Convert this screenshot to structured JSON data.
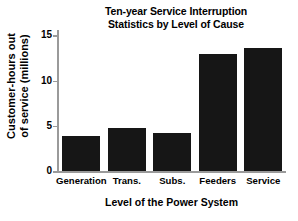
{
  "chart_data": {
    "type": "bar",
    "title": "Ten-year Service Interruption Statistics by Level of Cause",
    "title_lines": [
      "Ten-year Service Interruption",
      "Statistics by Level of Cause"
    ],
    "categories": [
      "Generation",
      "Trans.",
      "Subs.",
      "Feeders",
      "Service"
    ],
    "values": [
      3.9,
      4.8,
      4.2,
      12.9,
      13.6
    ],
    "xlabel": "Level of the Power System",
    "ylabel": "Customer-hours out of service (millions)",
    "ylabel_lines": [
      "Customer-hours out",
      "of service (millions)"
    ],
    "ylim": [
      0,
      15.6
    ],
    "yticks": [
      0,
      5,
      10,
      15
    ],
    "ytick_labels": [
      "0",
      "5",
      "10",
      "15"
    ],
    "grid": false,
    "legend": null,
    "bar_color": "#161616",
    "axis_color": "#9a9a9a",
    "text_color": "#000000",
    "background_color": "#ffffff"
  }
}
